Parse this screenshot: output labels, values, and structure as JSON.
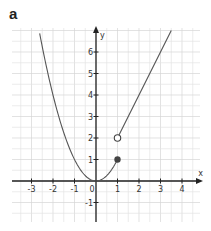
{
  "panel_label": "a",
  "chart_data": {
    "type": "line",
    "title": "",
    "xlabel": "x",
    "ylabel": "y",
    "xlim": [
      -3.9,
      4.8
    ],
    "ylim": [
      -1.9,
      7.1
    ],
    "grid": true,
    "grid_minor_step": 0.5,
    "x_ticks": [
      -3,
      -2,
      -1,
      0,
      1,
      2,
      3,
      4
    ],
    "y_ticks": [
      -1,
      1,
      2,
      3,
      4,
      5,
      6
    ],
    "x_tick_labels": [
      "-3",
      "-2",
      "-1",
      "0",
      "1",
      "2",
      "3",
      "4"
    ],
    "y_tick_labels": [
      "-1",
      "1",
      "2",
      "3",
      "4",
      "5",
      "6"
    ],
    "series": [
      {
        "name": "f(x) = x^2, x <= 1",
        "expression": "x^2",
        "domain": [
          -2.62,
          1
        ],
        "x": [
          -2.6,
          -2,
          -1,
          0,
          1
        ],
        "y": [
          6.76,
          4,
          1,
          0,
          1
        ],
        "color": "#555555"
      },
      {
        "name": "f(x) = 2x, x > 1",
        "expression": "2x",
        "domain": [
          1,
          3.5
        ],
        "x": [
          1,
          2,
          3,
          3.5
        ],
        "y": [
          2,
          4,
          6,
          7
        ],
        "color": "#555555"
      }
    ],
    "points": [
      {
        "x": 1,
        "y": 1,
        "style": "closed"
      },
      {
        "x": 1,
        "y": 2,
        "style": "open"
      }
    ]
  },
  "colors": {
    "curve": "#555555",
    "axis": "#222222",
    "grid": "#e4e4e4",
    "grid_major": "#d6d6d6"
  }
}
